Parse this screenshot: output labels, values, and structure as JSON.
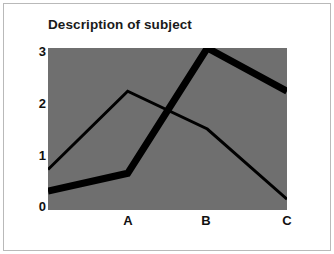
{
  "chart_data": {
    "type": "line",
    "title": "Description of subject",
    "xlabel": "",
    "ylabel": "",
    "categories": [
      "",
      "A",
      "B",
      "C"
    ],
    "x": [
      0,
      1,
      2,
      3
    ],
    "xtick_labels": [
      "A",
      "B",
      "C"
    ],
    "ytick_labels": [
      "0",
      "1",
      "2",
      "3"
    ],
    "yticks": [
      0,
      1,
      2,
      3
    ],
    "ylim": [
      0,
      3
    ],
    "xlim": [
      0,
      3
    ],
    "grid": false,
    "legend": "none",
    "plot_background_color": "#6f6f6f",
    "figure_background_color": "#ffffff",
    "series": [
      {
        "name": "thin-line",
        "color": "#000000",
        "line_width": 2,
        "values": [
          0.75,
          2.2,
          1.5,
          0.2
        ]
      },
      {
        "name": "thick-line",
        "color": "#000000",
        "line_width": 6,
        "values": [
          0.35,
          0.68,
          3.0,
          2.2
        ]
      }
    ]
  },
  "figure": {
    "title": "Description of subject"
  },
  "axes": {
    "y": {
      "ticks": [
        {
          "label": "3",
          "value": 3
        },
        {
          "label": "2",
          "value": 2
        },
        {
          "label": "1",
          "value": 1
        },
        {
          "label": "0",
          "value": 0
        }
      ]
    },
    "x": {
      "ticks": [
        {
          "label": "A",
          "value": 1
        },
        {
          "label": "B",
          "value": 2
        },
        {
          "label": "C",
          "value": 3
        }
      ]
    }
  }
}
